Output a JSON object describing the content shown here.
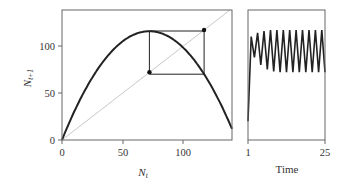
{
  "chart_data": [
    {
      "type": "line",
      "title": "",
      "xlabel": "N_t",
      "ylabel": "N_t+1",
      "xlim": [
        0,
        140
      ],
      "ylim": [
        0,
        140
      ],
      "x_ticks": [
        0,
        50,
        100
      ],
      "y_ticks": [
        0,
        50,
        100
      ],
      "grid": false,
      "series": [
        {
          "name": "map curve",
          "function": "N_t+1 = 3.22*N_t - 0.0224*N_t^2",
          "color": "#222222"
        },
        {
          "name": "1:1 line",
          "x": [
            0,
            140
          ],
          "y": [
            0,
            140
          ],
          "color": "#c8c8c8"
        },
        {
          "name": "cobweb 2-cycle",
          "x": [
            72,
            72,
            117,
            117,
            72
          ],
          "y": [
            72,
            116,
            116,
            70,
            70
          ],
          "color": "#222222"
        }
      ],
      "points": [
        {
          "x": 72,
          "y": 72
        },
        {
          "x": 117,
          "y": 117
        }
      ]
    },
    {
      "type": "line",
      "xlabel": "Time",
      "ylabel": "",
      "xlim": [
        1,
        25
      ],
      "ylim": [
        0,
        140
      ],
      "x_ticks": [
        1,
        25
      ],
      "series": [
        {
          "name": "population",
          "x": [
            1,
            2,
            3,
            4,
            5,
            6,
            7,
            8,
            9,
            10,
            11,
            12,
            13,
            14,
            15,
            16,
            17,
            18,
            19,
            20,
            21,
            22,
            23,
            24,
            25
          ],
          "y": [
            20,
            110,
            88,
            114,
            80,
            116,
            75,
            117,
            73,
            117,
            72,
            117,
            72,
            117,
            72,
            117,
            72,
            117,
            72,
            117,
            72,
            117,
            72,
            117,
            72
          ],
          "color": "#222222"
        }
      ]
    }
  ],
  "labels": {
    "y0": "0",
    "y50": "50",
    "y100": "100",
    "x0": "0",
    "x50": "50",
    "x100": "100",
    "t1": "1",
    "t25": "25",
    "xlabel_main": "N",
    "xlabel_sub": "t",
    "ylabel_main": "N",
    "ylabel_sub": "t+1",
    "time_label": "Time"
  }
}
